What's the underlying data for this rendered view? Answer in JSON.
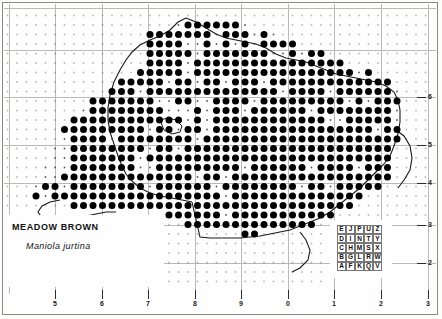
{
  "map": {
    "title": "MEADOW BROWN",
    "scientific_name": "Maniola jurtina",
    "type": "species-distribution-dot-map",
    "region": "British Isles (England and Wales)",
    "dot_symbol": "filled-circle",
    "dot_meaning": "recorded-10km-square",
    "small_dot_meaning": "10km-square-grid-reference",
    "background_color": "#fefefe",
    "dot_color": "#000000",
    "gridline_color": "#b9b9b5",
    "frame_color": "#8a8a88"
  },
  "axes": {
    "bottom_labels": [
      "5",
      "6",
      "7",
      "8",
      "9",
      "0",
      "1",
      "2",
      "3"
    ],
    "bottom_x": [
      55,
      102,
      148,
      195,
      241,
      288,
      334,
      381,
      428
    ],
    "right_labels": [
      "6",
      "5",
      "4",
      "3",
      "2"
    ],
    "right_y": [
      97,
      145,
      183,
      225,
      263
    ],
    "bottom_tick_y": 290,
    "right_tick_x": 417,
    "label_row_y": 300
  },
  "grid": {
    "vertical_x": [
      9,
      55,
      102,
      148,
      195,
      241,
      288,
      334,
      381,
      428
    ],
    "horizontal_y": [
      8,
      50,
      97,
      145,
      183,
      225,
      263
    ],
    "cell_size_km": 100
  },
  "legend": {
    "name": "national-grid-letter-key",
    "rows": [
      [
        "E",
        "J",
        "P",
        "U",
        "Z"
      ],
      [
        "D",
        "I",
        "N",
        "T",
        "Y"
      ],
      [
        "C",
        "H",
        "M",
        "S",
        "X"
      ],
      [
        "B",
        "G",
        "L",
        "R",
        "W"
      ],
      [
        "A",
        "F",
        "K",
        "Q",
        "V"
      ]
    ]
  },
  "chart_data": {
    "type": "scatter",
    "title": "MEADOW BROWN",
    "subtitle": "Maniola jurtina",
    "xlabel": "",
    "ylabel": "",
    "note": "Presence dots on a 10km national-grid lattice; dot spacing 9.5px, origin x=7.5 y=6.0"
  }
}
